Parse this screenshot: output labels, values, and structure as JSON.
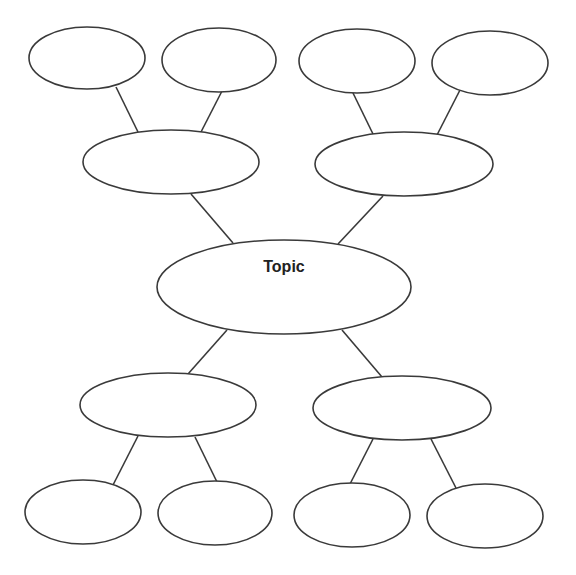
{
  "diagram": {
    "type": "mind-map",
    "stroke_color": "#3a3a3a",
    "background": "#ffffff",
    "center": {
      "id": "topic",
      "label": "Topic",
      "cx": 284,
      "cy": 287,
      "rx": 127,
      "ry": 47
    },
    "branches": [
      {
        "id": "branch-top-left",
        "label": "",
        "cx": 171,
        "cy": 162,
        "rx": 88,
        "ry": 32,
        "children": [
          {
            "id": "leaf-1",
            "label": "",
            "cx": 87,
            "cy": 58,
            "rx": 58,
            "ry": 31
          },
          {
            "id": "leaf-2",
            "label": "",
            "cx": 219,
            "cy": 60,
            "rx": 57,
            "ry": 32
          }
        ]
      },
      {
        "id": "branch-top-right",
        "label": "",
        "cx": 404,
        "cy": 164,
        "rx": 89,
        "ry": 32,
        "children": [
          {
            "id": "leaf-3",
            "label": "",
            "cx": 357,
            "cy": 61,
            "rx": 58,
            "ry": 32
          },
          {
            "id": "leaf-4",
            "label": "",
            "cx": 490,
            "cy": 63,
            "rx": 58,
            "ry": 32
          }
        ]
      },
      {
        "id": "branch-bottom-left",
        "label": "",
        "cx": 168,
        "cy": 405,
        "rx": 88,
        "ry": 32,
        "children": [
          {
            "id": "leaf-5",
            "label": "",
            "cx": 83,
            "cy": 512,
            "rx": 58,
            "ry": 32
          },
          {
            "id": "leaf-6",
            "label": "",
            "cx": 215,
            "cy": 513,
            "rx": 57,
            "ry": 32
          }
        ]
      },
      {
        "id": "branch-bottom-right",
        "label": "",
        "cx": 402,
        "cy": 408,
        "rx": 89,
        "ry": 32,
        "children": [
          {
            "id": "leaf-7",
            "label": "",
            "cx": 352,
            "cy": 515,
            "rx": 58,
            "ry": 32
          },
          {
            "id": "leaf-8",
            "label": "",
            "cx": 485,
            "cy": 516,
            "rx": 58,
            "ry": 32
          }
        ]
      }
    ],
    "edges": [
      {
        "from": "topic",
        "to": "branch-top-left",
        "x1": 233,
        "y1": 243,
        "x2": 191,
        "y2": 194
      },
      {
        "from": "topic",
        "to": "branch-top-right",
        "x1": 338,
        "y1": 244,
        "x2": 383,
        "y2": 196
      },
      {
        "from": "topic",
        "to": "branch-bottom-left",
        "x1": 227,
        "y1": 330,
        "x2": 188,
        "y2": 374
      },
      {
        "from": "topic",
        "to": "branch-bottom-right",
        "x1": 342,
        "y1": 330,
        "x2": 382,
        "y2": 377
      },
      {
        "from": "branch-top-left",
        "to": "leaf-1",
        "x1": 116,
        "y1": 87,
        "x2": 138,
        "y2": 132
      },
      {
        "from": "branch-top-left",
        "to": "leaf-2",
        "x1": 222,
        "y1": 91,
        "x2": 201,
        "y2": 132
      },
      {
        "from": "branch-top-right",
        "to": "leaf-3",
        "x1": 353,
        "y1": 93,
        "x2": 373,
        "y2": 134
      },
      {
        "from": "branch-top-right",
        "to": "leaf-4",
        "x1": 460,
        "y1": 90,
        "x2": 437,
        "y2": 135
      },
      {
        "from": "branch-bottom-left",
        "to": "leaf-5",
        "x1": 138,
        "y1": 436,
        "x2": 113,
        "y2": 485
      },
      {
        "from": "branch-bottom-left",
        "to": "leaf-6",
        "x1": 195,
        "y1": 437,
        "x2": 217,
        "y2": 482
      },
      {
        "from": "branch-bottom-right",
        "to": "leaf-7",
        "x1": 373,
        "y1": 439,
        "x2": 350,
        "y2": 484
      },
      {
        "from": "branch-bottom-right",
        "to": "leaf-8",
        "x1": 431,
        "y1": 439,
        "x2": 456,
        "y2": 488
      }
    ]
  }
}
